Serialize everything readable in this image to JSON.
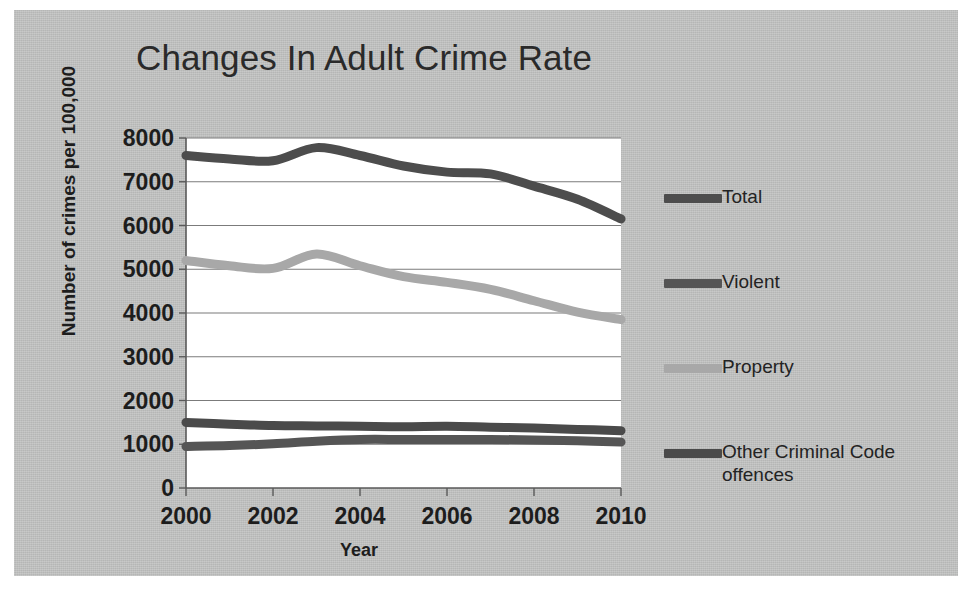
{
  "chart_data": {
    "type": "line",
    "title": "Changes In Adult Crime Rate",
    "xlabel": "Year",
    "ylabel": "Number of crimes per 100,000",
    "xlim": [
      2000,
      2010
    ],
    "ylim": [
      0,
      8000
    ],
    "ytick_step": 1000,
    "xtick_step": 2,
    "grid": true,
    "legend_position": "right",
    "ytick_labels": [
      "8000",
      "7000",
      "6000",
      "5000",
      "4000",
      "3000",
      "2000",
      "1000",
      "0"
    ],
    "xtick_labels": [
      "2000",
      "2002",
      "2004",
      "2006",
      "2008",
      "2010"
    ],
    "x": [
      2000,
      2001,
      2002,
      2003,
      2004,
      2005,
      2006,
      2007,
      2008,
      2009,
      2010
    ],
    "series": [
      {
        "name": "Total",
        "color": "#4d4d4d",
        "width": 9,
        "values": [
          7600,
          7520,
          7480,
          7780,
          7600,
          7360,
          7220,
          7180,
          6900,
          6600,
          6150
        ]
      },
      {
        "name": "Violent",
        "color": "#555555",
        "width": 9,
        "values": [
          950,
          970,
          1010,
          1070,
          1110,
          1110,
          1110,
          1110,
          1100,
          1080,
          1050
        ]
      },
      {
        "name": "Property",
        "color": "#a8a8a8",
        "width": 9,
        "values": [
          5200,
          5080,
          5020,
          5350,
          5080,
          4830,
          4700,
          4540,
          4280,
          4020,
          3850
        ]
      },
      {
        "name": "Other Criminal Code offences",
        "color": "#4a4a4a",
        "width": 9,
        "values": [
          1500,
          1460,
          1430,
          1420,
          1410,
          1400,
          1410,
          1390,
          1370,
          1340,
          1310
        ]
      }
    ]
  },
  "legend": {
    "items": [
      {
        "label": "Total",
        "color": "#4d4d4d"
      },
      {
        "label": "Violent",
        "color": "#555555"
      },
      {
        "label": "Property",
        "color": "#a8a8a8"
      },
      {
        "label": "Other Criminal Code offences",
        "color": "#4a4a4a"
      }
    ]
  },
  "colors": {
    "paper": "#c3c4c3",
    "plot_background": "#ffffff",
    "gridline": "#7b7b7b",
    "text": "#1d1d1d"
  }
}
